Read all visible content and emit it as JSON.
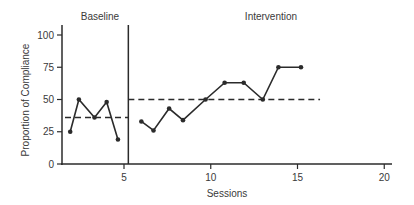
{
  "chart_data": {
    "type": "line",
    "title": "",
    "xlabel": "Sessions",
    "ylabel": "Proportion of Compliance",
    "xlim": [
      1.6,
      21
    ],
    "ylim": [
      0,
      105
    ],
    "xticks": [
      5,
      10,
      15,
      20
    ],
    "yticks": [
      0,
      25,
      50,
      75,
      100
    ],
    "grid": false,
    "legend": null,
    "phases": [
      {
        "name": "Baseline",
        "label_x": 3.7
      },
      {
        "name": "Intervention",
        "label_x": 13.3
      }
    ],
    "phase_change_x": 5.25,
    "series": [
      {
        "name": "Baseline",
        "x": [
          1.9,
          2.4,
          3.3,
          4.0,
          4.65
        ],
        "values": [
          25,
          50,
          36,
          48,
          19
        ]
      },
      {
        "name": "Intervention",
        "x": [
          6.0,
          6.7,
          7.6,
          8.4,
          9.7,
          10.8,
          11.9,
          13.0,
          13.9,
          15.2
        ],
        "values": [
          33,
          26,
          43,
          34,
          50,
          63,
          63,
          50,
          75,
          75
        ]
      }
    ],
    "mean_lines": [
      {
        "phase": "Baseline",
        "value": 36,
        "x_start": 1.6,
        "x_end": 5.25
      },
      {
        "phase": "Intervention",
        "value": 50,
        "x_start": 5.25,
        "x_end": 16.3
      }
    ],
    "annotations": [
      "Baseline",
      "Intervention"
    ]
  },
  "labels": {
    "baseline": "Baseline",
    "intervention": "Intervention",
    "xlabel": "Sessions",
    "ylabel": "Proportion of Compliance",
    "yticks": [
      "0",
      "25",
      "50",
      "75",
      "100"
    ],
    "xticks": [
      "5",
      "10",
      "15",
      "20"
    ]
  }
}
